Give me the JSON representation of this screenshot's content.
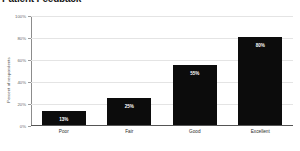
{
  "chart_data": {
    "type": "bar",
    "title": "Patient Feedback",
    "categories": [
      "Poor",
      "Fair",
      "Good",
      "Excellent"
    ],
    "values": [
      13,
      25,
      55,
      80
    ],
    "value_labels": [
      "13%",
      "25%",
      "55%",
      "80%"
    ],
    "xlabel": "",
    "ylabel": "Percent of respondents",
    "ylim": [
      0,
      100
    ],
    "ytick_labels": [
      "0%",
      "20%",
      "40%",
      "60%",
      "80%",
      "100%"
    ],
    "ytick_values": [
      0,
      20,
      40,
      60,
      80,
      100
    ],
    "grid": true,
    "legend": false,
    "bar_color": "#0c0c0c",
    "grid_color": "#e4e4e4",
    "axis_color": "#555555",
    "value_label_color": "#ffffff"
  }
}
